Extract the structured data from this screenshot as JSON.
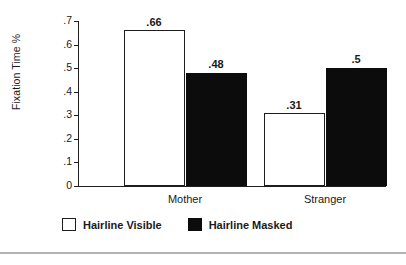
{
  "chart_data": {
    "type": "bar",
    "title": "",
    "xlabel": "",
    "ylabel": "Fixation Time %",
    "categories": [
      "Mother",
      "Stranger"
    ],
    "series": [
      {
        "name": "Hairline Visible",
        "color": "#ffffff",
        "values": [
          0.66,
          0.31
        ],
        "labels": [
          ".66",
          ".31"
        ]
      },
      {
        "name": "Hairline Masked",
        "color": "#0c0c0c",
        "values": [
          0.48,
          0.5
        ],
        "labels": [
          ".48",
          ".5"
        ]
      }
    ],
    "ylim": [
      0,
      0.7
    ],
    "yticks": [
      0,
      0.1,
      0.2,
      0.3,
      0.4,
      0.5,
      0.6,
      0.7
    ],
    "ytick_labels": [
      "0",
      ".1",
      ".2",
      ".3",
      ".4",
      ".5",
      ".6",
      ".7"
    ],
    "grid": false,
    "legend_position": "bottom-left"
  },
  "axis": {
    "y_title": "Fixation Time %"
  },
  "legend": {
    "items": [
      {
        "label": "Hairline Visible",
        "swatch": "white-square-swatch"
      },
      {
        "label": "Hairline Masked",
        "swatch": "black-square-swatch"
      }
    ]
  },
  "colors": {
    "axis": "#1d1d1d",
    "bar_masked": "#0c0c0c",
    "bar_visible": "#ffffff",
    "rule": "#b3b3b3",
    "background": "#ffffff"
  }
}
